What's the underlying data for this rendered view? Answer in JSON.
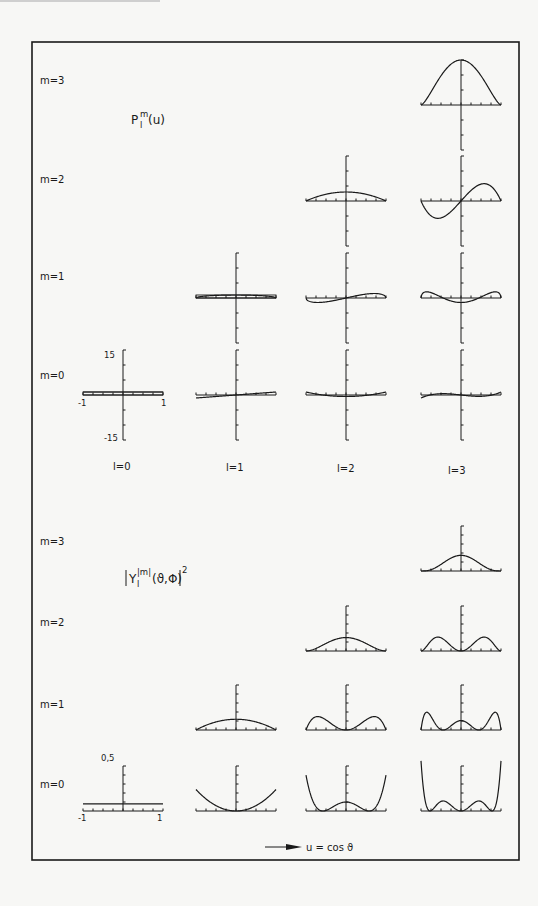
{
  "chart_data": [
    {
      "type": "line",
      "title": "P_l^m(u)",
      "panel": "top",
      "xlabel": "u = cos ϑ",
      "x_range": [
        -1,
        1
      ],
      "ylim": [
        -15,
        15
      ],
      "axis_labels": {
        "y_top": "15",
        "y_bottom": "-15",
        "x_left": "-1",
        "x_right": "1"
      },
      "row_labels": [
        "m=3",
        "m=2",
        "m=1",
        "m=0"
      ],
      "column_labels": [
        "l=0",
        "l=1",
        "l=2",
        "l=3"
      ],
      "grid": false,
      "series": [
        {
          "name": "l=0,m=0",
          "l": 0,
          "m": 0,
          "formula": "1",
          "points": [
            [
              -1,
              1
            ],
            [
              0,
              1
            ],
            [
              1,
              1
            ]
          ]
        },
        {
          "name": "l=1,m=0",
          "l": 1,
          "m": 0,
          "formula": "u",
          "points": [
            [
              -1,
              -1
            ],
            [
              0,
              0
            ],
            [
              1,
              1
            ]
          ]
        },
        {
          "name": "l=1,m=1",
          "l": 1,
          "m": 1,
          "formula": "sqrt(1-u^2)",
          "points": [
            [
              -1,
              0
            ],
            [
              -0.5,
              0.87
            ],
            [
              0,
              1
            ],
            [
              0.5,
              0.87
            ],
            [
              1,
              0
            ]
          ]
        },
        {
          "name": "l=2,m=0",
          "l": 2,
          "m": 0,
          "formula": "(3u^2-1)/2",
          "points": [
            [
              -1,
              1
            ],
            [
              -0.5,
              -0.125
            ],
            [
              0,
              -0.5
            ],
            [
              0.5,
              -0.125
            ],
            [
              1,
              1
            ]
          ]
        },
        {
          "name": "l=2,m=1",
          "l": 2,
          "m": 1,
          "formula": "3u*sqrt(1-u^2)",
          "points": [
            [
              -1,
              0
            ],
            [
              -0.71,
              -1.5
            ],
            [
              0,
              0
            ],
            [
              0.71,
              1.5
            ],
            [
              1,
              0
            ]
          ]
        },
        {
          "name": "l=2,m=2",
          "l": 2,
          "m": 2,
          "formula": "3(1-u^2)",
          "points": [
            [
              -1,
              0
            ],
            [
              -0.5,
              2.25
            ],
            [
              0,
              3
            ],
            [
              0.5,
              2.25
            ],
            [
              1,
              0
            ]
          ]
        },
        {
          "name": "l=3,m=0",
          "l": 3,
          "m": 0,
          "formula": "(5u^3-3u)/2",
          "points": [
            [
              -1,
              -1
            ],
            [
              -0.45,
              0.45
            ],
            [
              0,
              0
            ],
            [
              0.45,
              -0.45
            ],
            [
              1,
              1
            ]
          ]
        },
        {
          "name": "l=3,m=1",
          "l": 3,
          "m": 1,
          "formula": "1.5(5u^2-1)sqrt(1-u^2)",
          "points": [
            [
              -1,
              0
            ],
            [
              -0.82,
              2.4
            ],
            [
              0,
              -1.5
            ],
            [
              0.82,
              2.4
            ],
            [
              1,
              0
            ]
          ]
        },
        {
          "name": "l=3,m=2",
          "l": 3,
          "m": 2,
          "formula": "15u(1-u^2)",
          "points": [
            [
              -1,
              0
            ],
            [
              -0.58,
              -5.8
            ],
            [
              0,
              0
            ],
            [
              0.58,
              5.8
            ],
            [
              1,
              0
            ]
          ]
        },
        {
          "name": "l=3,m=3",
          "l": 3,
          "m": 3,
          "formula": "15(1-u^2)^1.5",
          "points": [
            [
              -1,
              0
            ],
            [
              -0.5,
              9.74
            ],
            [
              0,
              15
            ],
            [
              0.5,
              9.74
            ],
            [
              1,
              0
            ]
          ]
        }
      ]
    },
    {
      "type": "line",
      "title": "|Y_l^|m|(ϑ,Φ)|^2",
      "panel": "bottom",
      "xlabel": "u = cos ϑ",
      "x_range": [
        -1,
        1
      ],
      "ylim": [
        0,
        0.5
      ],
      "axis_labels": {
        "y_top": "0,5",
        "x_left": "-1",
        "x_right": "1"
      },
      "row_labels": [
        "m=3",
        "m=2",
        "m=1",
        "m=0"
      ],
      "grid": false,
      "series": [
        {
          "name": "l=0,m=0",
          "l": 0,
          "m": 0,
          "formula": "1/(4π)",
          "points": [
            [
              -1,
              0.0796
            ],
            [
              0,
              0.0796
            ],
            [
              1,
              0.0796
            ]
          ]
        },
        {
          "name": "l=1,m=0",
          "l": 1,
          "m": 0,
          "formula": "3u^2/(4π)",
          "points": [
            [
              -1,
              0.239
            ],
            [
              -0.5,
              0.06
            ],
            [
              0,
              0
            ],
            [
              0.5,
              0.06
            ],
            [
              1,
              0.239
            ]
          ]
        },
        {
          "name": "l=1,m=1",
          "l": 1,
          "m": 1,
          "formula": "3(1-u^2)/(8π)",
          "points": [
            [
              -1,
              0
            ],
            [
              -0.5,
              0.09
            ],
            [
              0,
              0.119
            ],
            [
              0.5,
              0.09
            ],
            [
              1,
              0
            ]
          ]
        },
        {
          "name": "l=2,m=0",
          "l": 2,
          "m": 0,
          "formula": "5(3u^2-1)^2/(16π)",
          "points": [
            [
              -1,
              0.398
            ],
            [
              -0.58,
              0
            ],
            [
              0,
              0.099
            ],
            [
              0.58,
              0
            ],
            [
              1,
              0.398
            ]
          ]
        },
        {
          "name": "l=2,m=1",
          "l": 2,
          "m": 1,
          "formula": "15u^2(1-u^2)/(8π)",
          "points": [
            [
              -1,
              0
            ],
            [
              -0.71,
              0.149
            ],
            [
              0,
              0
            ],
            [
              0.71,
              0.149
            ],
            [
              1,
              0
            ]
          ]
        },
        {
          "name": "l=2,m=2",
          "l": 2,
          "m": 2,
          "formula": "15(1-u^2)^2/(32π)",
          "points": [
            [
              -1,
              0
            ],
            [
              -0.5,
              0.084
            ],
            [
              0,
              0.149
            ],
            [
              0.5,
              0.084
            ],
            [
              1,
              0
            ]
          ]
        },
        {
          "name": "l=3,m=0",
          "l": 3,
          "m": 0,
          "formula": "7(5u^3-3u)^2/(16π)",
          "points": [
            [
              -1,
              0.557
            ],
            [
              -0.77,
              0
            ],
            [
              -0.45,
              0.1
            ],
            [
              0,
              0
            ],
            [
              0.45,
              0.1
            ],
            [
              0.77,
              0
            ],
            [
              1,
              0.557
            ]
          ]
        },
        {
          "name": "l=3,m=1",
          "l": 3,
          "m": 1,
          "formula": "21(1-u^2)(5u^2-1)^2/(64π)",
          "points": [
            [
              -1,
              0
            ],
            [
              -0.82,
              0.19
            ],
            [
              -0.45,
              0
            ],
            [
              0,
              0.104
            ],
            [
              0.45,
              0
            ],
            [
              0.82,
              0.19
            ],
            [
              1,
              0
            ]
          ]
        },
        {
          "name": "l=3,m=2",
          "l": 3,
          "m": 2,
          "formula": "105u^2(1-u^2)^2/(32π)",
          "points": [
            [
              -1,
              0
            ],
            [
              -0.58,
              0.155
            ],
            [
              0,
              0
            ],
            [
              0.58,
              0.155
            ],
            [
              1,
              0
            ]
          ]
        },
        {
          "name": "l=3,m=3",
          "l": 3,
          "m": 3,
          "formula": "35(1-u^2)^3/(64π)",
          "points": [
            [
              -1,
              0
            ],
            [
              -0.5,
              0.073
            ],
            [
              0,
              0.174
            ],
            [
              0.5,
              0.073
            ],
            [
              1,
              0
            ]
          ]
        }
      ]
    }
  ],
  "figure": {
    "top_title": {
      "base": "P",
      "sup": "m",
      "sub": "l",
      "tail": "(u)"
    },
    "bottom_title": {
      "base": "Y",
      "sup": "|m|",
      "sub": "l",
      "tail": "(ϑ,Φ)",
      "outer_sup": "2"
    },
    "top_rows": [
      "m=3",
      "m=2",
      "m=1",
      "m=0"
    ],
    "bottom_rows": [
      "m=3",
      "m=2",
      "m=1",
      "m=0"
    ],
    "columns": [
      "l=0",
      "l=1",
      "l=2",
      "l=3"
    ],
    "top_y_max": "15",
    "top_y_min": "-15",
    "bottom_y_max": "0,5",
    "x_min": "-1",
    "x_max": "1",
    "x_axis_caption": "u = cos ϑ"
  }
}
